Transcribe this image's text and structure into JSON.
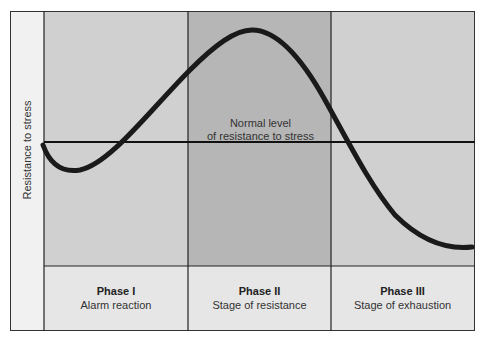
{
  "diagram": {
    "y_axis_label": "Resistance to stress",
    "normal_line_label_line1": "Normal level",
    "normal_line_label_line2": "of resistance to stress",
    "phases": [
      {
        "title": "Phase I",
        "subtitle": "Alarm reaction",
        "shade": "#d0d0d0"
      },
      {
        "title": "Phase II",
        "subtitle": "Stage of resistance",
        "shade": "#b6b6b6"
      },
      {
        "title": "Phase III",
        "subtitle": "Stage of exhaustion",
        "shade": "#d0d0d0"
      }
    ],
    "colors": {
      "light_region": "#d0d0d0",
      "dark_region": "#b6b6b6",
      "label_row": "#e6e6e6",
      "axis_strip": "#f1f1f1",
      "curve": "#1a1a1a",
      "lines": "#222222"
    },
    "curve_shape": "Starts at normal level, dips during Phase I, rises to peak above normal in Phase II, then falls below normal into Phase III"
  }
}
